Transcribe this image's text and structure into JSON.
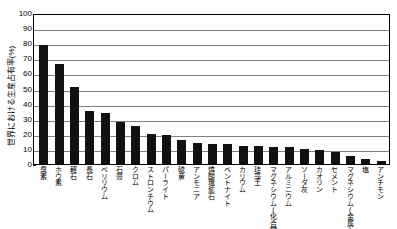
{
  "chart_data": {
    "type": "bar",
    "title": "",
    "xlabel": "",
    "ylabel": "世界における生産占有率(%)",
    "ylim": [
      0,
      100
    ],
    "ytick_values": [
      0,
      10,
      20,
      30,
      40,
      50,
      60,
      70,
      80,
      90,
      100
    ],
    "ytick_labels": [
      "0",
      "10",
      "20",
      "30",
      "40",
      "50",
      "60",
      "70",
      "80",
      "90",
      "100"
    ],
    "grid": true,
    "legend": "none",
    "bar_color": "#111111",
    "gridline_color": "#808080",
    "axis_color": "#000000",
    "categories": [
      "臭素",
      "ホウ素",
      "軽石",
      "長石",
      "ベリリウム",
      "石膏",
      "クロム",
      "ストロンチウム",
      "パーライト",
      "硫黄",
      "アンモニア",
      "燐酸塩鉱石",
      "ベントナイト",
      "カリウム",
      "珪藻土",
      "マグネシウム(化合物)",
      "アルミニウム",
      "ソーダ灰",
      "カオリン",
      "セメント",
      "マグネシウム(金属)",
      "塩",
      "アンチモン"
    ],
    "values": [
      79,
      66,
      51,
      35,
      34,
      28,
      25,
      20,
      19,
      16,
      14,
      13,
      13,
      12,
      12,
      11,
      11,
      10,
      9,
      8,
      5,
      3,
      2
    ]
  }
}
